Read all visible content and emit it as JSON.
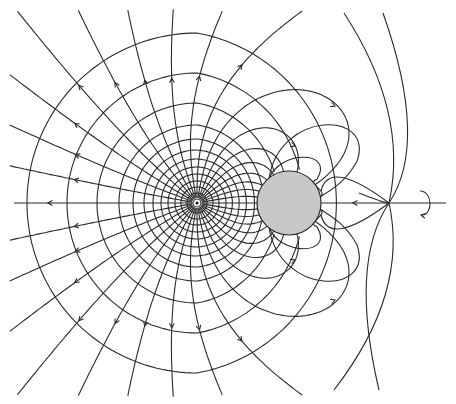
{
  "figure": {
    "width": 456,
    "height": 404,
    "colors": {
      "line": "#2a2a2a",
      "sphere_fill": "#c8c8c8",
      "sphere_stroke": "#2a2a2a",
      "background": "#ffffff"
    },
    "axis": {
      "y": 203,
      "x_start": 14,
      "x_end": 446,
      "arrow_x": 48,
      "right_arrow_x": 353
    },
    "charge": {
      "x": 197,
      "y": 203,
      "r_outer": 4,
      "r_dot": 1.5
    },
    "sphere": {
      "x": 289,
      "y": 203,
      "r": 32
    },
    "rotation_symbol": {
      "x": 425,
      "y": 203,
      "label": "rotation-about-axis"
    },
    "crossing_point": {
      "x": 389,
      "y": 203
    },
    "radial_line_count": 36,
    "equipotential_radii": [
      10,
      16,
      22,
      29,
      36,
      44,
      53,
      64,
      78,
      100,
      130,
      170
    ],
    "lobes_upper": [
      {
        "peak_x": 355,
        "peak_y": 110,
        "arrow": true
      },
      {
        "peak_x": 315,
        "peak_y": 150,
        "arrow": true
      }
    ],
    "lobes_lower": [
      {
        "peak_x": 355,
        "peak_y": 296,
        "arrow": true
      },
      {
        "peak_x": 315,
        "peak_y": 256,
        "arrow": true
      }
    ]
  }
}
